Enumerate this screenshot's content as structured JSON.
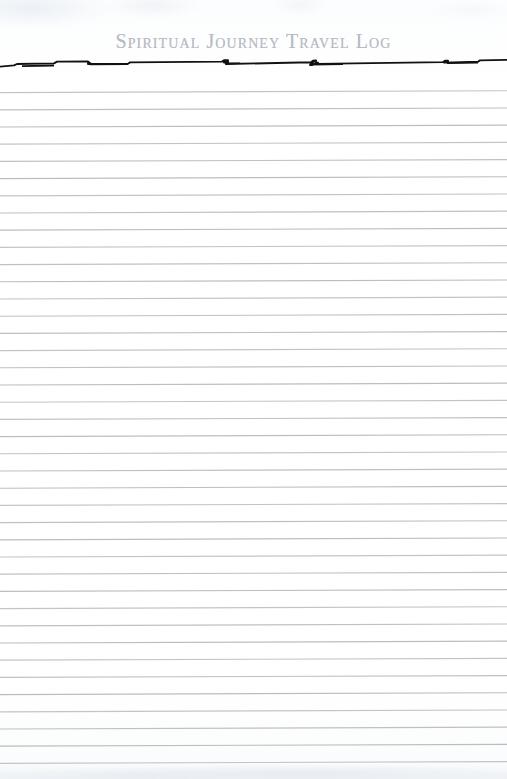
{
  "document": {
    "title": "Spiritual Journey Travel Log",
    "title_display": "Spiritual Journey Travel Log",
    "type": "ruled-notebook-page",
    "paper_color": "#ffffff",
    "title_color": "#b9bcc4",
    "rule_color": "#b4b9c0",
    "accent_rule_color": "#111111"
  },
  "header": {
    "title": "Spiritual Journey Travel Log",
    "divider_label": "hand-drawn torn rule"
  },
  "body": {
    "line_count": 40,
    "first_line_y": 91,
    "line_pitch": 17.2,
    "lines": [
      {
        "index": 1,
        "text": ""
      },
      {
        "index": 2,
        "text": ""
      },
      {
        "index": 3,
        "text": ""
      },
      {
        "index": 4,
        "text": ""
      },
      {
        "index": 5,
        "text": ""
      },
      {
        "index": 6,
        "text": ""
      },
      {
        "index": 7,
        "text": ""
      },
      {
        "index": 8,
        "text": ""
      },
      {
        "index": 9,
        "text": ""
      },
      {
        "index": 10,
        "text": ""
      },
      {
        "index": 11,
        "text": ""
      },
      {
        "index": 12,
        "text": ""
      },
      {
        "index": 13,
        "text": ""
      },
      {
        "index": 14,
        "text": ""
      },
      {
        "index": 15,
        "text": ""
      },
      {
        "index": 16,
        "text": ""
      },
      {
        "index": 17,
        "text": ""
      },
      {
        "index": 18,
        "text": ""
      },
      {
        "index": 19,
        "text": ""
      },
      {
        "index": 20,
        "text": ""
      },
      {
        "index": 21,
        "text": ""
      },
      {
        "index": 22,
        "text": ""
      },
      {
        "index": 23,
        "text": ""
      },
      {
        "index": 24,
        "text": ""
      },
      {
        "index": 25,
        "text": ""
      },
      {
        "index": 26,
        "text": ""
      },
      {
        "index": 27,
        "text": ""
      },
      {
        "index": 28,
        "text": ""
      },
      {
        "index": 29,
        "text": ""
      },
      {
        "index": 30,
        "text": ""
      },
      {
        "index": 31,
        "text": ""
      },
      {
        "index": 32,
        "text": ""
      },
      {
        "index": 33,
        "text": ""
      },
      {
        "index": 34,
        "text": ""
      },
      {
        "index": 35,
        "text": ""
      },
      {
        "index": 36,
        "text": ""
      },
      {
        "index": 37,
        "text": ""
      },
      {
        "index": 38,
        "text": ""
      },
      {
        "index": 39,
        "text": ""
      },
      {
        "index": 40,
        "text": ""
      }
    ]
  }
}
